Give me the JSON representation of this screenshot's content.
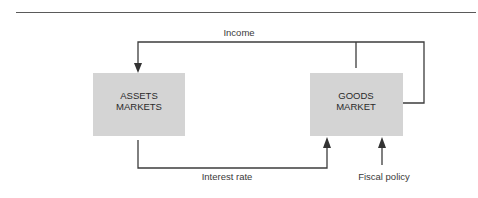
{
  "diagram": {
    "nodes": [
      {
        "id": "assets",
        "line1": "ASSETS",
        "line2": "MARKETS"
      },
      {
        "id": "goods",
        "line1": "GOODS",
        "line2": "MARKET"
      }
    ],
    "edges": [
      {
        "from": "goods",
        "to": "assets",
        "label": "Income"
      },
      {
        "from": "assets",
        "to": "goods",
        "label": "Interest rate"
      },
      {
        "from": "external",
        "to": "goods",
        "label": "Fiscal policy"
      }
    ],
    "colors": {
      "box_fill": "#d4d4d4",
      "line": "#3c3c3c"
    }
  }
}
